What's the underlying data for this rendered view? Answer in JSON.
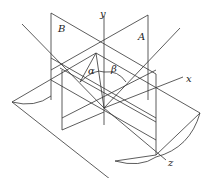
{
  "diagram": {
    "title": "",
    "labels": {
      "plane_b": "B",
      "plane_a": "A",
      "axis_y": "y",
      "axis_x": "x",
      "axis_z": "z",
      "angle_alpha": "α",
      "angle_beta": "β"
    },
    "colors": {
      "line": "#333333",
      "background": "#ffffff"
    }
  }
}
